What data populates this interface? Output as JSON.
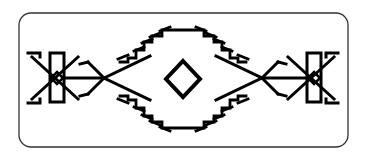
{
  "figure": {
    "colors": {
      "background": "#ffffff",
      "stroke": "#000000",
      "border": "#333333"
    },
    "elements": {
      "border": "rounded-rectangle-frame",
      "center": "diamond-outline",
      "left_motif": "bar-with-crossed-arrows-and-small-diamond",
      "right_motif": "bar-with-crossed-arrows-and-small-diamond",
      "upper_band": "stepped-hook-chevron-band",
      "lower_band": "stepped-hook-chevron-band"
    }
  }
}
